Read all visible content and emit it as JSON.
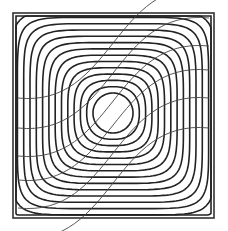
{
  "diagram": {
    "type": "contour-plot",
    "frame": {
      "x": 13,
      "y": 13,
      "width": 201,
      "height": 205
    },
    "center": {
      "x": 113,
      "y": 113
    },
    "contour_count": 15,
    "inner_radius": 20,
    "contour_spacing": 6.3,
    "streamline_count": 6,
    "colors": {
      "contour": "#222222",
      "streamline": "#444444",
      "frame": "#333333",
      "background": "#ffffff"
    }
  }
}
